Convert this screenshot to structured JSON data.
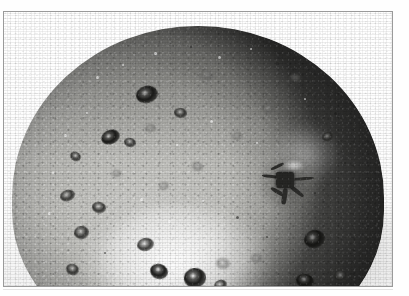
{
  "figure": {
    "domain": "Natural-Image",
    "media_type": "grayscale-halftone-photograph",
    "frame": {
      "border_color": "#9a9a9a",
      "background": "#ffffff"
    },
    "caption": "",
    "label": ""
  },
  "photo": {
    "background_color": "#ffffff",
    "palette": {
      "skin_light": "#c6c6c2",
      "skin_mid": "#a9a9a5",
      "skin_dark": "#585854",
      "rim_shadow": "#3e3e3a",
      "lesion_dark": "#1e1e1c",
      "highlight": "#ffffff"
    },
    "lighting": {
      "key_light_direction": "upper-left",
      "specular_highlight_position": "lower-centre-left",
      "shadow_side": "right"
    }
  },
  "fruit": {
    "shape": "sphere-cropped-at-bottom",
    "calyx": {
      "name": "calyx-stem-cavity",
      "position_x": 255,
      "position_y": 142,
      "description": "dark star-shaped cavity with radiating dried sepals"
    },
    "lesions": [
      {
        "x": 132,
        "y": 74,
        "w": 22,
        "h": 17,
        "rot": -14,
        "style": "dark"
      },
      {
        "x": 170,
        "y": 96,
        "w": 13,
        "h": 10,
        "rot": 8,
        "style": ""
      },
      {
        "x": 196,
        "y": 58,
        "w": 13,
        "h": 10,
        "rot": 20,
        "style": "faint"
      },
      {
        "x": 97,
        "y": 118,
        "w": 19,
        "h": 14,
        "rot": -22,
        "style": "dark"
      },
      {
        "x": 120,
        "y": 126,
        "w": 12,
        "h": 9,
        "rot": 12,
        "style": ""
      },
      {
        "x": 141,
        "y": 112,
        "w": 11,
        "h": 8,
        "rot": -5,
        "style": "faint"
      },
      {
        "x": 66,
        "y": 140,
        "w": 11,
        "h": 9,
        "rot": 30,
        "style": ""
      },
      {
        "x": 56,
        "y": 178,
        "w": 15,
        "h": 11,
        "rot": -18,
        "style": ""
      },
      {
        "x": 88,
        "y": 190,
        "w": 14,
        "h": 11,
        "rot": 10,
        "style": ""
      },
      {
        "x": 70,
        "y": 214,
        "w": 15,
        "h": 13,
        "rot": -8,
        "style": ""
      },
      {
        "x": 62,
        "y": 252,
        "w": 13,
        "h": 11,
        "rot": 22,
        "style": ""
      },
      {
        "x": 133,
        "y": 226,
        "w": 17,
        "h": 13,
        "rot": -12,
        "style": ""
      },
      {
        "x": 146,
        "y": 252,
        "w": 18,
        "h": 15,
        "rot": 16,
        "style": "dark"
      },
      {
        "x": 180,
        "y": 256,
        "w": 22,
        "h": 20,
        "rot": -6,
        "style": "dark"
      },
      {
        "x": 212,
        "y": 246,
        "w": 14,
        "h": 11,
        "rot": 8,
        "style": "faint"
      },
      {
        "x": 210,
        "y": 268,
        "w": 13,
        "h": 10,
        "rot": -20,
        "style": ""
      },
      {
        "x": 247,
        "y": 242,
        "w": 11,
        "h": 9,
        "rot": 4,
        "style": "faint"
      },
      {
        "x": 300,
        "y": 218,
        "w": 21,
        "h": 18,
        "rot": -16,
        "style": "dark"
      },
      {
        "x": 292,
        "y": 262,
        "w": 18,
        "h": 14,
        "rot": 10,
        "style": "dark"
      },
      {
        "x": 330,
        "y": 258,
        "w": 14,
        "h": 12,
        "rot": -4,
        "style": ""
      },
      {
        "x": 258,
        "y": 92,
        "w": 12,
        "h": 9,
        "rot": 14,
        "style": "faint"
      },
      {
        "x": 228,
        "y": 120,
        "w": 10,
        "h": 8,
        "rot": -10,
        "style": "faint"
      },
      {
        "x": 188,
        "y": 150,
        "w": 11,
        "h": 9,
        "rot": 24,
        "style": "faint"
      },
      {
        "x": 155,
        "y": 170,
        "w": 10,
        "h": 8,
        "rot": -16,
        "style": "faint"
      },
      {
        "x": 108,
        "y": 158,
        "w": 9,
        "h": 7,
        "rot": 6,
        "style": "faint"
      },
      {
        "x": 318,
        "y": 120,
        "w": 12,
        "h": 9,
        "rot": -24,
        "style": ""
      },
      {
        "x": 286,
        "y": 62,
        "w": 11,
        "h": 8,
        "rot": 18,
        "style": "faint"
      }
    ],
    "flecks": [
      {
        "x": 92,
        "y": 64,
        "s": 3,
        "light": true
      },
      {
        "x": 118,
        "y": 52,
        "s": 2,
        "light": true
      },
      {
        "x": 150,
        "y": 40,
        "s": 3,
        "light": true
      },
      {
        "x": 186,
        "y": 34,
        "s": 2,
        "light": false
      },
      {
        "x": 214,
        "y": 44,
        "s": 3,
        "light": true
      },
      {
        "x": 246,
        "y": 36,
        "s": 2,
        "light": true
      },
      {
        "x": 272,
        "y": 50,
        "s": 3,
        "light": false
      },
      {
        "x": 300,
        "y": 86,
        "s": 2,
        "light": true
      },
      {
        "x": 330,
        "y": 100,
        "s": 3,
        "light": false
      },
      {
        "x": 340,
        "y": 150,
        "s": 2,
        "light": false
      },
      {
        "x": 82,
        "y": 100,
        "s": 2,
        "light": true
      },
      {
        "x": 60,
        "y": 122,
        "s": 3,
        "light": true
      },
      {
        "x": 48,
        "y": 160,
        "s": 2,
        "light": true
      },
      {
        "x": 44,
        "y": 200,
        "s": 3,
        "light": true
      },
      {
        "x": 100,
        "y": 240,
        "s": 2,
        "light": false
      },
      {
        "x": 164,
        "y": 208,
        "s": 3,
        "light": true
      },
      {
        "x": 198,
        "y": 188,
        "s": 2,
        "light": true
      },
      {
        "x": 232,
        "y": 204,
        "s": 3,
        "light": false
      },
      {
        "x": 262,
        "y": 224,
        "s": 2,
        "light": false
      },
      {
        "x": 206,
        "y": 108,
        "s": 3,
        "light": true
      },
      {
        "x": 172,
        "y": 132,
        "s": 2,
        "light": true
      },
      {
        "x": 136,
        "y": 186,
        "s": 3,
        "light": true
      },
      {
        "x": 252,
        "y": 130,
        "s": 2,
        "light": true
      },
      {
        "x": 310,
        "y": 180,
        "s": 2,
        "light": false
      }
    ]
  }
}
